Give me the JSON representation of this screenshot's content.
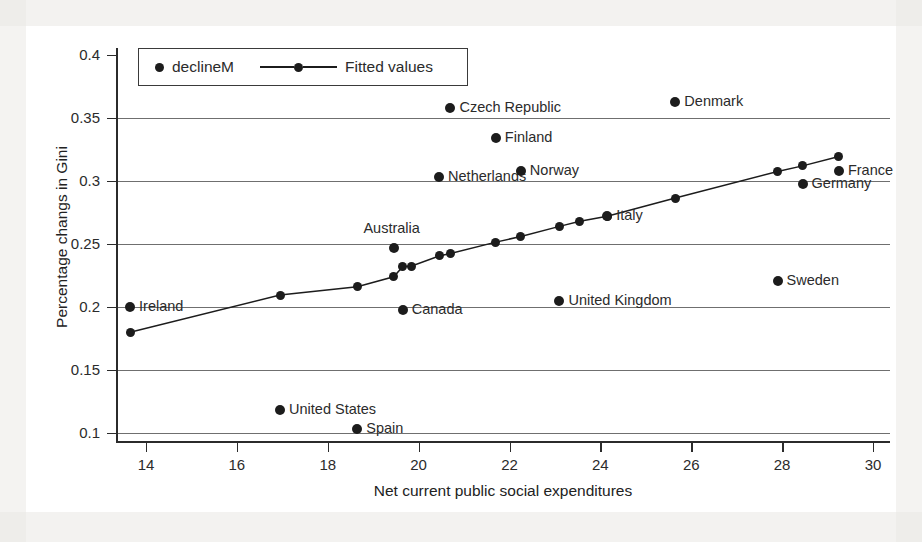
{
  "chart_data": {
    "type": "scatter",
    "title": "",
    "xlabel": "Net current public social expenditures",
    "ylabel": "Percentage changs in Gini",
    "xlim": [
      13.0,
      30.4
    ],
    "ylim": [
      0.09,
      0.41
    ],
    "xticks": [
      "14",
      "16",
      "18",
      "20",
      "22",
      "24",
      "26",
      "28",
      "30"
    ],
    "xtick_values": [
      14,
      16,
      18,
      20,
      22,
      24,
      26,
      28,
      30
    ],
    "yticks": [
      "0.4",
      "0.35",
      "0.3",
      "0.25",
      "0.2",
      "0.15",
      "0.1"
    ],
    "ytick_values": [
      0.4,
      0.35,
      0.3,
      0.25,
      0.2,
      0.15,
      0.1
    ],
    "grid": "horizontal",
    "legend_position": "top-left",
    "series": [
      {
        "name": "declineM",
        "marker": "filled-circle",
        "points": [
          {
            "label": "Ireland",
            "x": 13.65,
            "y": 0.2,
            "label_pos": "right"
          },
          {
            "label": "United States",
            "x": 16.95,
            "y": 0.1185,
            "label_pos": "right"
          },
          {
            "label": "Spain",
            "x": 18.65,
            "y": 0.1035,
            "label_pos": "right"
          },
          {
            "label": "Australia",
            "x": 19.45,
            "y": 0.2465,
            "label_pos": "above"
          },
          {
            "label": "Canada",
            "x": 19.65,
            "y": 0.1975,
            "label_pos": "right"
          },
          {
            "label": "Netherlands",
            "x": 20.45,
            "y": 0.303,
            "label_pos": "right"
          },
          {
            "label": "Czech Republic",
            "x": 20.7,
            "y": 0.358,
            "label_pos": "right"
          },
          {
            "label": "Finland",
            "x": 21.7,
            "y": 0.3345,
            "label_pos": "right"
          },
          {
            "label": "Norway",
            "x": 22.25,
            "y": 0.308,
            "label_pos": "right"
          },
          {
            "label": "United Kingdom",
            "x": 23.1,
            "y": 0.2045,
            "label_pos": "right"
          },
          {
            "label": "Italy",
            "x": 24.15,
            "y": 0.2725,
            "label_pos": "right"
          },
          {
            "label": "Denmark",
            "x": 25.65,
            "y": 0.363,
            "label_pos": "right"
          },
          {
            "label": "Sweden",
            "x": 27.9,
            "y": 0.221,
            "label_pos": "right"
          },
          {
            "label": "Germany",
            "x": 28.45,
            "y": 0.2975,
            "label_pos": "right"
          },
          {
            "label": "France",
            "x": 29.25,
            "y": 0.308,
            "label_pos": "right"
          }
        ]
      },
      {
        "name": "Fitted values",
        "marker": "filled-circle-with-line",
        "points": [
          {
            "x": 13.65,
            "y": 0.18
          },
          {
            "x": 16.95,
            "y": 0.2095
          },
          {
            "x": 18.65,
            "y": 0.216
          },
          {
            "x": 19.45,
            "y": 0.224
          },
          {
            "x": 19.65,
            "y": 0.232
          },
          {
            "x": 19.85,
            "y": 0.2325
          },
          {
            "x": 20.45,
            "y": 0.2405
          },
          {
            "x": 20.7,
            "y": 0.2425
          },
          {
            "x": 21.7,
            "y": 0.2515
          },
          {
            "x": 22.25,
            "y": 0.256
          },
          {
            "x": 23.1,
            "y": 0.264
          },
          {
            "x": 23.55,
            "y": 0.268
          },
          {
            "x": 24.15,
            "y": 0.272
          },
          {
            "x": 25.65,
            "y": 0.2865
          },
          {
            "x": 27.9,
            "y": 0.3075
          },
          {
            "x": 28.45,
            "y": 0.312
          },
          {
            "x": 29.25,
            "y": 0.3195
          }
        ]
      }
    ]
  },
  "legend": {
    "entries": [
      {
        "label": "declineM",
        "style": "dot"
      },
      {
        "label": "Fitted values",
        "style": "line-dot"
      }
    ]
  }
}
